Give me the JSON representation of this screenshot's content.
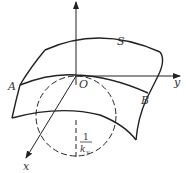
{
  "diagram": {
    "type": "saddle-surface-curvature",
    "labels": {
      "surface": "S",
      "origin": "O",
      "point_a": "A",
      "point_b": "B",
      "axis_x": "x",
      "axis_y": "y",
      "axis_z": "",
      "radius_numerator": "1",
      "radius_denominator": "k",
      "radius_subscript": "y"
    },
    "colors": {
      "stroke": "#222222",
      "text": "#333333",
      "background": "#ffffff"
    }
  }
}
